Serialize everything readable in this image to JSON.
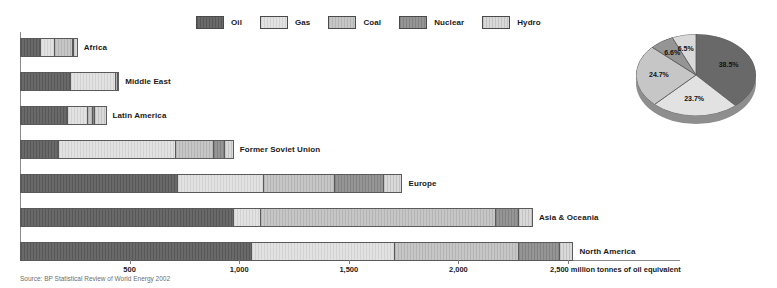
{
  "legend": {
    "items": [
      {
        "label": "Oil",
        "key": "oil",
        "color": "#696969"
      },
      {
        "label": "Gas",
        "key": "gas",
        "color": "#e2e2e2"
      },
      {
        "label": "Coal",
        "key": "coal",
        "color": "#c6c6c6"
      },
      {
        "label": "Nuclear",
        "key": "nuclear",
        "color": "#959595"
      },
      {
        "label": "Hydro",
        "key": "hydro",
        "color": "#d9d9d9"
      }
    ]
  },
  "source": "Source: BP Statistical Review of World Energy 2002",
  "axis": {
    "unit_label": "2,500 million tonnes of oil equivalent",
    "ticks": [
      {
        "value": 500,
        "label": "500"
      },
      {
        "value": 1000,
        "label": "1,000"
      },
      {
        "value": 1500,
        "label": "1,500"
      },
      {
        "value": 2000,
        "label": "2,000"
      },
      {
        "value": 2500,
        "label": "2,500"
      }
    ]
  },
  "chart_data": {
    "type": "bar",
    "orientation": "horizontal",
    "stacked": true,
    "title": "",
    "xlabel": "million tonnes of oil equivalent",
    "ylabel": "",
    "xlim": [
      0,
      2700
    ],
    "grid": false,
    "legend_position": "top",
    "categories": [
      "Africa",
      "Middle East",
      "Latin America",
      "Former Soviet Union",
      "Europe",
      "Asia & Oceania",
      "North America"
    ],
    "series": [
      {
        "name": "Oil",
        "values": [
          96,
          233,
          219,
          180,
          720,
          975,
          1060
        ]
      },
      {
        "name": "Gas",
        "values": [
          62,
          207,
          93,
          530,
          395,
          125,
          650
        ]
      },
      {
        "name": "Coal",
        "values": [
          83,
          8,
          20,
          175,
          320,
          1070,
          565
        ]
      },
      {
        "name": "Nuclear",
        "values": [
          3,
          0,
          8,
          50,
          225,
          105,
          190
        ]
      },
      {
        "name": "Hydro",
        "values": [
          18,
          2,
          55,
          40,
          85,
          65,
          60
        ]
      }
    ],
    "totals": [
      262,
      450,
      395,
      975,
      1745,
      2340,
      2525
    ],
    "pie": {
      "title": "",
      "slices": [
        {
          "name": "Oil",
          "label": "38.5%",
          "value": 38.5
        },
        {
          "name": "Gas",
          "label": "23.7%",
          "value": 23.7
        },
        {
          "name": "Coal",
          "label": "24.7%",
          "value": 24.7
        },
        {
          "name": "Nuclear",
          "label": "6.6%",
          "value": 6.6
        },
        {
          "name": "Hydro",
          "label": "6.5%",
          "value": 6.5
        }
      ]
    }
  }
}
